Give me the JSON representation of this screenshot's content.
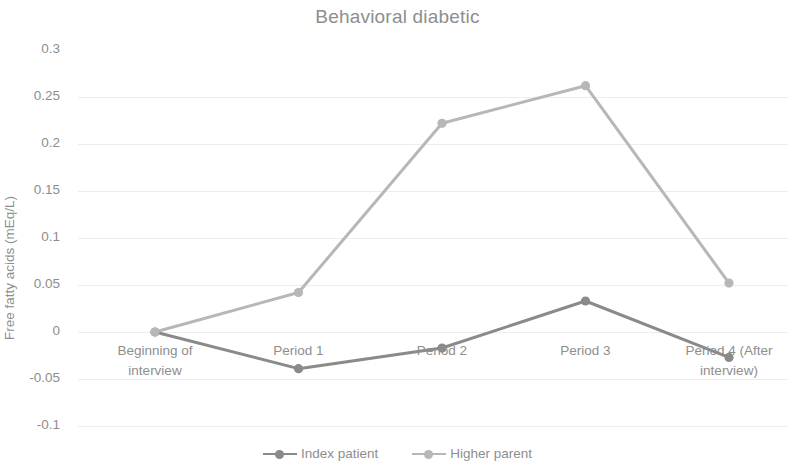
{
  "chart_data": {
    "type": "line",
    "title": "Behavioral diabetic",
    "xlabel": "",
    "ylabel": "Free fatty acids (mEq/L)",
    "categories": [
      "Beginning of interview",
      "Period 1",
      "Period 2",
      "Period 3",
      "Period 4 (After interview)"
    ],
    "series": [
      {
        "name": "Index patient",
        "color": "#8a8a8a",
        "values": [
          0,
          -0.039,
          -0.017,
          0.033,
          -0.027
        ]
      },
      {
        "name": "Higher parent",
        "color": "#b7b7b7",
        "values": [
          0,
          0.042,
          0.222,
          0.262,
          0.052
        ]
      }
    ],
    "ylim": [
      -0.1,
      0.3
    ],
    "ytick_labels": [
      "0.3",
      "0.25",
      "0.2",
      "0.15",
      "0.1",
      "0.05",
      "0",
      "-0.05",
      "-0.1"
    ],
    "ytick_values": [
      0.3,
      0.25,
      0.2,
      0.15,
      0.1,
      0.05,
      0,
      -0.05,
      -0.1
    ],
    "grid": true,
    "legend_position": "bottom",
    "background": "#ffffff",
    "text_color": "#8e8e8e",
    "grid_color": "#ededed"
  },
  "legend": {
    "entries": [
      {
        "label": "Index patient",
        "color": "#8a8a8a"
      },
      {
        "label": "Higher parent",
        "color": "#b7b7b7"
      }
    ]
  }
}
